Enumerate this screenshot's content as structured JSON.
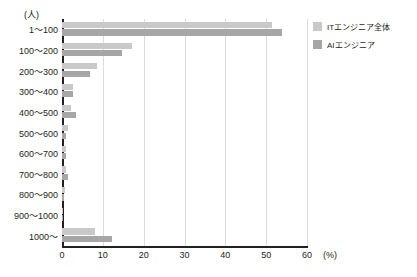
{
  "chart_data": {
    "type": "bar",
    "orientation": "horizontal",
    "title": "",
    "xlabel": "(%)",
    "ylabel": "(人)",
    "xlim": [
      0,
      60
    ],
    "xticks": [
      0,
      10,
      20,
      30,
      40,
      50,
      60
    ],
    "grid": true,
    "legend_position": "top-right",
    "categories": [
      "1～100",
      "100～200",
      "200～300",
      "300～400",
      "400～500",
      "500～600",
      "600～700",
      "700～800",
      "800～900",
      "900～1000",
      "1000～"
    ],
    "series": [
      {
        "name": "ITエンジニア全体",
        "color": "#c9c9c9",
        "values": [
          51.5,
          17.2,
          8.6,
          2.6,
          2.2,
          1.5,
          0.9,
          0.9,
          0.7,
          0.2,
          8.2
        ]
      },
      {
        "name": "AIエンジニア",
        "color": "#a6a6a6",
        "values": [
          53.9,
          14.7,
          6.9,
          2.6,
          3.4,
          1.1,
          1.0,
          1.5,
          0.5,
          0.2,
          12.2
        ]
      }
    ]
  },
  "legend": {
    "items": [
      {
        "label": "ITエンジニア全体",
        "color": "#c9c9c9"
      },
      {
        "label": "AIエンジニア",
        "color": "#a6a6a6"
      }
    ]
  },
  "axis": {
    "y_unit": "(人)",
    "x_unit": "(%)",
    "x_tick_labels": [
      "0",
      "10",
      "20",
      "30",
      "40",
      "50",
      "60"
    ]
  }
}
